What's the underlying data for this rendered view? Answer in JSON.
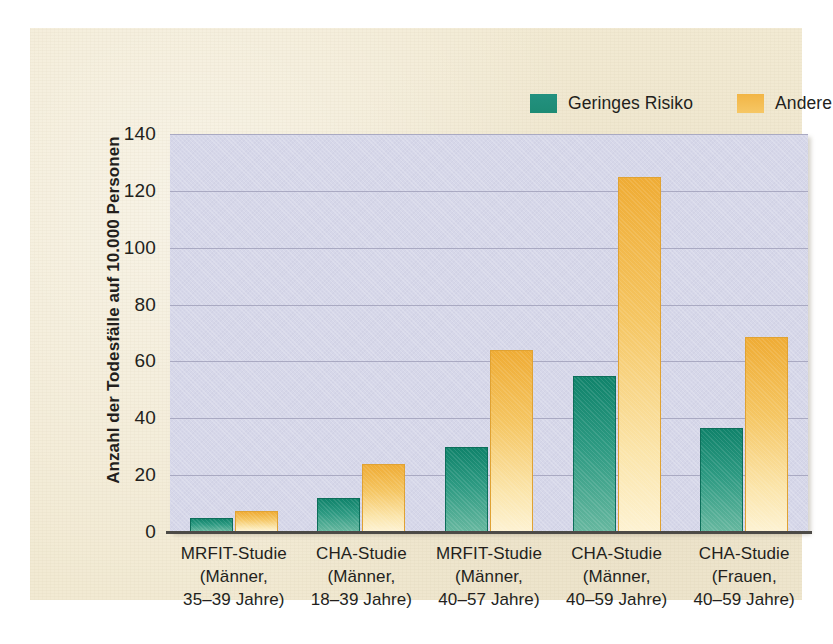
{
  "chart_data": {
    "type": "bar",
    "title": "",
    "xlabel": "",
    "ylabel": "Anzahl der Todesfälle auf 10.000 Personen",
    "ylim": [
      0,
      140
    ],
    "yticks": [
      0,
      20,
      40,
      60,
      80,
      100,
      120,
      140
    ],
    "grid": true,
    "legend_position": "top-right",
    "categories": [
      "MRFIT-Studie (Männer, 35–39 Jahre)",
      "CHA-Studie (Männer, 18–39 Jahre)",
      "MRFIT-Studie (Männer, 40–57 Jahre)",
      "CHA-Studie (Männer, 40–59 Jahre)",
      "CHA-Studie (Frauen, 40–59 Jahre)"
    ],
    "category_lines": [
      [
        "MRFIT-Studie",
        "(Männer,",
        "35–39 Jahre)"
      ],
      [
        "CHA-Studie",
        "(Männer,",
        "18–39 Jahre)"
      ],
      [
        "MRFIT-Studie",
        "(Männer,",
        "40–57 Jahre)"
      ],
      [
        "CHA-Studie",
        "(Männer,",
        "40–59 Jahre)"
      ],
      [
        "CHA-Studie",
        "(Frauen,",
        "40–59 Jahre)"
      ]
    ],
    "series": [
      {
        "name": "Geringes Risiko",
        "color": "#1d8b74",
        "values": [
          5,
          12,
          30,
          55,
          36.5
        ]
      },
      {
        "name": "Andere",
        "color": "#f2b545",
        "values": [
          7.5,
          24,
          64,
          125,
          68.5
        ]
      }
    ]
  },
  "legend": {
    "entries": [
      {
        "label": "Geringes Risiko",
        "swatch": "green"
      },
      {
        "label": "Andere",
        "swatch": "orange"
      }
    ]
  },
  "axis": {
    "y_title": "Anzahl der Todesfälle auf 10.000 Personen",
    "y_tick_labels": [
      "140",
      "120",
      "100",
      "80",
      "60",
      "40",
      "20",
      "0"
    ]
  },
  "colors": {
    "paper": "#f2ead3",
    "plot_background": "#d6d7e9",
    "gridline": "#9a9ab4",
    "axis": "#4c4a46",
    "series_low_risk": "#1d8b74",
    "series_other": "#f2b545",
    "text": "#231f1c"
  }
}
